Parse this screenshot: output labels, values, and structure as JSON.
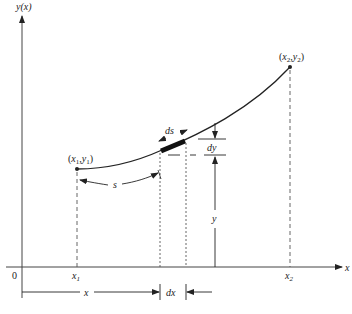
{
  "diagram": {
    "type": "arc-length-element",
    "axes": {
      "y_axis_label": "y(x)",
      "x_axis_label": "x",
      "origin_label": "0"
    },
    "points": {
      "start": {
        "label_x": "x",
        "label_sub_x": "1",
        "label_y": "y",
        "label_sub_y": "1"
      },
      "end": {
        "label_x": "x",
        "label_sub_x": "2",
        "label_y": "y",
        "label_sub_y": "2"
      }
    },
    "ticks": {
      "x1": {
        "base": "x",
        "sub": "1"
      },
      "x2": {
        "base": "x",
        "sub": "2"
      }
    },
    "annotations": {
      "arc_length": "s",
      "element_arc": "ds",
      "element_dy": "dy",
      "height": "y",
      "distance_x": "x",
      "element_dx": "dx"
    },
    "colors": {
      "stroke": "#222222",
      "background": "#ffffff"
    }
  }
}
